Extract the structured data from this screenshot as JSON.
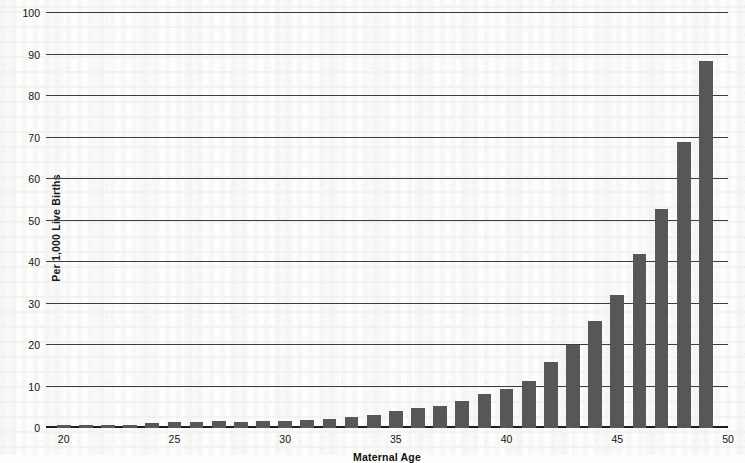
{
  "chart_data": {
    "type": "bar",
    "title": "",
    "xlabel": "Maternal Age",
    "ylabel": "Per 1,000 Live Births",
    "xlim": [
      19.2,
      50
    ],
    "ylim": [
      0,
      100
    ],
    "grid": true,
    "legend": "none",
    "bar_color": "#575757",
    "y_ticks": [
      0,
      10,
      20,
      30,
      40,
      50,
      60,
      70,
      80,
      90,
      100
    ],
    "x_ticks": [
      20,
      25,
      30,
      35,
      40,
      45,
      50
    ],
    "categories": [
      20,
      21,
      22,
      23,
      24,
      25,
      26,
      27,
      28,
      29,
      30,
      31,
      32,
      33,
      34,
      35,
      36,
      37,
      38,
      39,
      40,
      41,
      42,
      43,
      44,
      45,
      46,
      47,
      48,
      49
    ],
    "values": [
      0.7,
      0.7,
      0.8,
      0.8,
      1.2,
      1.4,
      1.5,
      1.6,
      1.5,
      1.6,
      1.7,
      1.9,
      2.1,
      2.7,
      3.1,
      4.0,
      4.8,
      5.4,
      6.6,
      8.2,
      9.5,
      11.4,
      15.8,
      20.0,
      25.8,
      32.0,
      42.0,
      52.8,
      68.8,
      88.5
    ]
  },
  "axes": {
    "y_label": "Per 1,000 Live Births",
    "x_label": "Maternal Age",
    "y_tick_labels": [
      "0",
      "10",
      "20",
      "30",
      "40",
      "50",
      "60",
      "70",
      "80",
      "90",
      "100"
    ],
    "x_tick_labels": [
      "20",
      "25",
      "30",
      "35",
      "40",
      "45",
      "50"
    ]
  }
}
